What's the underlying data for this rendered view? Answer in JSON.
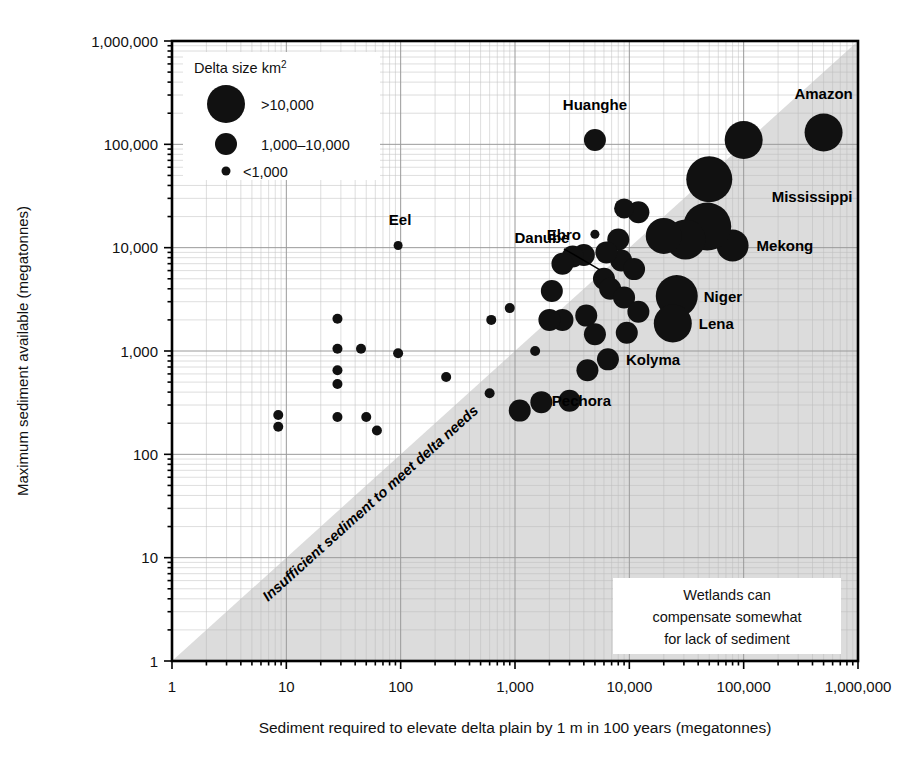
{
  "figure": {
    "background": "#ffffff",
    "bubble_color": "#111111",
    "shade_color": "#dcdcdc",
    "grid_color": "#b9b9b9",
    "axis_color": "#000000"
  },
  "legend": {
    "title": "Delta size km",
    "title_sup": "2",
    "items": [
      {
        "label": ">10,000",
        "radius_px": 19
      },
      {
        "label": "1,000–10,000",
        "radius_px": 11
      },
      {
        "label": "<1,000",
        "radius_px": 4.5
      }
    ]
  },
  "annotations": {
    "diagonal": "Insufficient sediment to meet delta needs",
    "note_box": [
      "Wetlands can",
      "compensate somewhat",
      "for lack of sediment"
    ]
  },
  "chart_data": {
    "type": "scatter",
    "title": "",
    "xlabel": "Sediment required to elevate delta plain by 1 m in 100 years (megatonnes)",
    "ylabel": "Maximum sediment available (megatonnes)",
    "xscale": "log",
    "yscale": "log",
    "xlim": [
      1,
      1000000
    ],
    "ylim": [
      1,
      1000000
    ],
    "xticks": [
      1,
      10,
      100,
      1000,
      10000,
      100000,
      1000000
    ],
    "xticklabels": [
      "1",
      "10",
      "100",
      "1,000",
      "10,000",
      "100,000",
      "1,000,000"
    ],
    "yticks": [
      1,
      10,
      100,
      1000,
      10000,
      100000,
      1000000
    ],
    "yticklabels": [
      "1",
      "10",
      "100",
      "1,000",
      "10,000",
      "100,000",
      "1,000,000"
    ],
    "grid": true,
    "legend_position": "top-left",
    "size_legend": [
      {
        "label": ">10,000",
        "radius_px": 19
      },
      {
        "label": "1,000–10,000",
        "radius_px": 11
      },
      {
        "label": "<1,000",
        "radius_px": 4.5
      }
    ],
    "reference_band": {
      "label": "Insufficient sediment to meet delta needs",
      "description": "Shaded region below the 1:1 line where x > y",
      "line": "y = x"
    },
    "points": [
      {
        "name": "Amazon",
        "x": 500000,
        "y": 130000,
        "r": 19,
        "label": "Amazon",
        "label_pos": "above"
      },
      {
        "name": "Mississippi",
        "x": 100000,
        "y": 110000,
        "r": 19,
        "label": "Mississippi",
        "label_pos": "right-below"
      },
      {
        "name": "Huanghe",
        "x": 5000,
        "y": 110000,
        "r": 11,
        "label": "Huanghe",
        "label_pos": "above"
      },
      {
        "name": "Mekong",
        "x": 80000,
        "y": 10500,
        "r": 16,
        "label": "Mekong",
        "label_pos": "right"
      },
      {
        "name": "Niger",
        "x": 26000,
        "y": 3400,
        "r": 21,
        "label": "Niger",
        "label_pos": "right"
      },
      {
        "name": "Lena",
        "x": 24000,
        "y": 1850,
        "r": 19,
        "label": "Lena",
        "label_pos": "right"
      },
      {
        "name": "Kolyma",
        "x": 6500,
        "y": 830,
        "r": 11,
        "label": "Kolyma",
        "label_pos": "right"
      },
      {
        "name": "Pechora",
        "x": 4300,
        "y": 650,
        "r": 11,
        "label": "Pechora",
        "label_pos": "below"
      },
      {
        "name": "Ebro",
        "x": 5000,
        "y": 13500,
        "r": 4.5,
        "label": "Ebro",
        "label_pos": "left"
      },
      {
        "name": "Danube",
        "x": 6000,
        "y": 5000,
        "r": 11,
        "label": "Danube",
        "label_pos": "leader"
      },
      {
        "name": "Eel",
        "x": 95,
        "y": 10500,
        "r": 4.5,
        "label": "Eel",
        "label_pos": "above"
      },
      {
        "name": "p01",
        "x": 50000,
        "y": 46000,
        "r": 23
      },
      {
        "name": "p02",
        "x": 48000,
        "y": 16000,
        "r": 24
      },
      {
        "name": "p03",
        "x": 31000,
        "y": 12000,
        "r": 20
      },
      {
        "name": "p04",
        "x": 20000,
        "y": 13000,
        "r": 18
      },
      {
        "name": "p05",
        "x": 12000,
        "y": 22000,
        "r": 11
      },
      {
        "name": "p06",
        "x": 9000,
        "y": 24000,
        "r": 10
      },
      {
        "name": "p07",
        "x": 8000,
        "y": 12000,
        "r": 11
      },
      {
        "name": "p08",
        "x": 8500,
        "y": 7500,
        "r": 11
      },
      {
        "name": "p09",
        "x": 11000,
        "y": 6200,
        "r": 11
      },
      {
        "name": "p10",
        "x": 6300,
        "y": 9000,
        "r": 11
      },
      {
        "name": "p11",
        "x": 6800,
        "y": 4000,
        "r": 11
      },
      {
        "name": "p12",
        "x": 9000,
        "y": 3300,
        "r": 11
      },
      {
        "name": "p13",
        "x": 4000,
        "y": 8500,
        "r": 11
      },
      {
        "name": "p14",
        "x": 3200,
        "y": 8200,
        "r": 11
      },
      {
        "name": "p15",
        "x": 2600,
        "y": 7000,
        "r": 11
      },
      {
        "name": "p16",
        "x": 2100,
        "y": 3800,
        "r": 11
      },
      {
        "name": "p17",
        "x": 2600,
        "y": 2000,
        "r": 11
      },
      {
        "name": "p18",
        "x": 2000,
        "y": 2000,
        "r": 11
      },
      {
        "name": "p19",
        "x": 4200,
        "y": 2200,
        "r": 11
      },
      {
        "name": "p20",
        "x": 5000,
        "y": 1450,
        "r": 11
      },
      {
        "name": "p21",
        "x": 9500,
        "y": 1500,
        "r": 11
      },
      {
        "name": "p22",
        "x": 12000,
        "y": 2400,
        "r": 11
      },
      {
        "name": "p23",
        "x": 3000,
        "y": 330,
        "r": 11
      },
      {
        "name": "p24",
        "x": 1700,
        "y": 320,
        "r": 11
      },
      {
        "name": "p25",
        "x": 1100,
        "y": 265,
        "r": 11
      },
      {
        "name": "p26",
        "x": 1500,
        "y": 1000,
        "r": 5
      },
      {
        "name": "p27",
        "x": 900,
        "y": 2600,
        "r": 5
      },
      {
        "name": "p28",
        "x": 620,
        "y": 2000,
        "r": 5
      },
      {
        "name": "p29",
        "x": 600,
        "y": 390,
        "r": 5
      },
      {
        "name": "p30",
        "x": 250,
        "y": 560,
        "r": 5
      },
      {
        "name": "p31",
        "x": 95,
        "y": 950,
        "r": 5
      },
      {
        "name": "p32",
        "x": 45,
        "y": 1050,
        "r": 5
      },
      {
        "name": "p33",
        "x": 28,
        "y": 2050,
        "r": 5
      },
      {
        "name": "p34",
        "x": 28,
        "y": 1050,
        "r": 5
      },
      {
        "name": "p35",
        "x": 28,
        "y": 650,
        "r": 5
      },
      {
        "name": "p36",
        "x": 28,
        "y": 480,
        "r": 5
      },
      {
        "name": "p37",
        "x": 28,
        "y": 230,
        "r": 5
      },
      {
        "name": "p38",
        "x": 50,
        "y": 230,
        "r": 5
      },
      {
        "name": "p39",
        "x": 62,
        "y": 170,
        "r": 5
      },
      {
        "name": "p40",
        "x": 8.5,
        "y": 240,
        "r": 5
      },
      {
        "name": "p41",
        "x": 8.5,
        "y": 185,
        "r": 5
      }
    ]
  }
}
